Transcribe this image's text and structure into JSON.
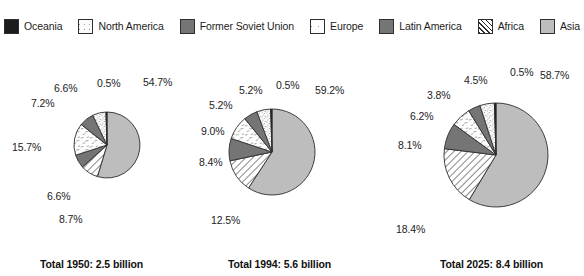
{
  "legend": {
    "items": [
      {
        "label": "Oceania",
        "key": "oceania",
        "swatch": "solid-black-swatch"
      },
      {
        "label": "North America",
        "key": "north-america",
        "swatch": "light-stipple-swatch"
      },
      {
        "label": "Former Soviet Union",
        "key": "fsu",
        "swatch": "dark-gray-swatch"
      },
      {
        "label": "Europe",
        "key": "europe",
        "swatch": "sparse-dash-swatch"
      },
      {
        "label": "Latin America",
        "key": "latin-america",
        "swatch": "dark-gray-swatch"
      },
      {
        "label": "Africa",
        "key": "africa",
        "swatch": "diagonal-hatch-swatch"
      },
      {
        "label": "Asia",
        "key": "asia",
        "swatch": "light-gray-swatch"
      }
    ]
  },
  "colors": {
    "oceania": "#1c1c1c",
    "north_america": "#fbfbfb",
    "fsu": "#757575",
    "europe": "#fdfdfd",
    "latin_america": "#757575",
    "africa": "#ffffff",
    "asia": "#bdbdbd",
    "outline": "#2e2e2e",
    "text": "#1c1c1c"
  },
  "chart_data": [
    {
      "type": "pie",
      "title": "Total 1950: 2.5 billion",
      "year": "1950",
      "total": "2.5 billion",
      "start_angle_deg": 0,
      "direction": "clockwise",
      "radius_px": 33,
      "categories": [
        "Asia",
        "Africa",
        "Latin America",
        "Europe",
        "Former Soviet Union",
        "North America",
        "Oceania"
      ],
      "values": [
        54.7,
        8.7,
        6.6,
        15.7,
        7.2,
        6.6,
        0.5
      ],
      "labels": [
        "54.7%",
        "8.7%",
        "6.6%",
        "15.7%",
        "7.2%",
        "6.6%",
        "0.5%"
      ],
      "keys": [
        "asia",
        "africa",
        "latin-america",
        "europe",
        "fsu",
        "north-america",
        "oceania"
      ],
      "unit": "%"
    },
    {
      "type": "pie",
      "title": "Total 1994: 5.6 billion",
      "year": "1994",
      "total": "5.6 billion",
      "start_angle_deg": 0,
      "direction": "clockwise",
      "radius_px": 43,
      "categories": [
        "Asia",
        "Africa",
        "Latin America",
        "Europe",
        "Former Soviet Union",
        "North America",
        "Oceania"
      ],
      "values": [
        59.2,
        12.5,
        8.4,
        9.0,
        5.2,
        5.2,
        0.5
      ],
      "labels": [
        "59.2%",
        "12.5%",
        "8.4%",
        "9.0%",
        "5.2%",
        "5.2%",
        "0.5%"
      ],
      "keys": [
        "asia",
        "africa",
        "latin-america",
        "europe",
        "fsu",
        "north-america",
        "oceania"
      ],
      "unit": "%"
    },
    {
      "type": "pie",
      "title": "Total 2025: 8.4 billion",
      "year": "2025",
      "total": "8.4 billion",
      "start_angle_deg": 0,
      "direction": "clockwise",
      "radius_px": 52,
      "categories": [
        "Asia",
        "Africa",
        "Latin America",
        "Europe",
        "Former Soviet Union",
        "North America",
        "Oceania"
      ],
      "values": [
        58.7,
        18.4,
        8.1,
        6.2,
        3.8,
        4.5,
        0.5
      ],
      "labels": [
        "58.7%",
        "18.4%",
        "8.1%",
        "6.2%",
        "3.8%",
        "4.5%",
        "0.5%"
      ],
      "keys": [
        "asia",
        "africa",
        "latin-america",
        "europe",
        "fsu",
        "north-america",
        "oceania"
      ],
      "unit": "%"
    }
  ],
  "layout": {
    "pies": [
      {
        "cx": 107,
        "cy": 105,
        "caption_x": 40,
        "caption_y": 219
      },
      {
        "cx": 272,
        "cy": 112,
        "caption_x": 228,
        "caption_y": 219
      },
      {
        "cx": 496,
        "cy": 115,
        "caption_x": 440,
        "caption_y": 219
      }
    ],
    "label_offsets": [
      [
        {
          "text_key": 0,
          "x": 143,
          "y": 37
        },
        {
          "text_key": 1,
          "x": 59,
          "y": 174
        },
        {
          "text_key": 2,
          "x": 47,
          "y": 151
        },
        {
          "text_key": 3,
          "x": 12,
          "y": 102
        },
        {
          "text_key": 4,
          "x": 31,
          "y": 58
        },
        {
          "text_key": 5,
          "x": 54,
          "y": 43
        },
        {
          "text_key": 6,
          "x": 97,
          "y": 38
        }
      ],
      [
        {
          "text_key": 0,
          "x": 315,
          "y": 45
        },
        {
          "text_key": 1,
          "x": 211,
          "y": 175
        },
        {
          "text_key": 2,
          "x": 199,
          "y": 117
        },
        {
          "text_key": 3,
          "x": 201,
          "y": 86
        },
        {
          "text_key": 4,
          "x": 209,
          "y": 60
        },
        {
          "text_key": 5,
          "x": 239,
          "y": 45
        },
        {
          "text_key": 6,
          "x": 276,
          "y": 40
        }
      ],
      [
        {
          "text_key": 0,
          "x": 540,
          "y": 30
        },
        {
          "text_key": 1,
          "x": 396,
          "y": 184
        },
        {
          "text_key": 2,
          "x": 398,
          "y": 100
        },
        {
          "text_key": 3,
          "x": 410,
          "y": 71
        },
        {
          "text_key": 4,
          "x": 427,
          "y": 50
        },
        {
          "text_key": 5,
          "x": 464,
          "y": 35
        },
        {
          "text_key": 6,
          "x": 510,
          "y": 27
        }
      ]
    ]
  }
}
